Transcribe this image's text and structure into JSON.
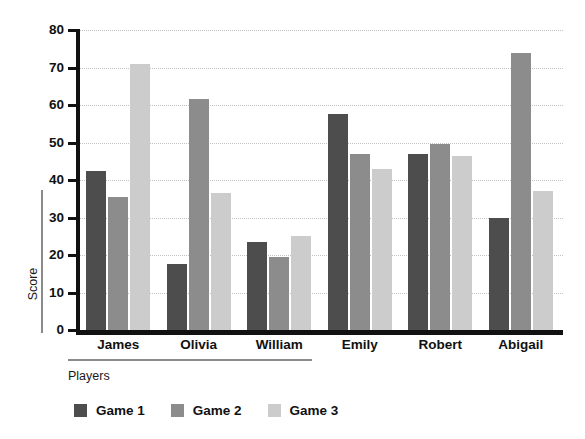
{
  "chart_data": {
    "type": "bar",
    "title": "",
    "xlabel": "Players",
    "ylabel": "Score",
    "categories": [
      "James",
      "Olivia",
      "William",
      "Emily",
      "Robert",
      "Abigail"
    ],
    "series": [
      {
        "name": "Game 1",
        "color": "#4d4d4d",
        "values": [
          42.5,
          17.5,
          23.5,
          57.5,
          47.0,
          30.0
        ]
      },
      {
        "name": "Game 2",
        "color": "#8c8c8c",
        "values": [
          35.5,
          61.5,
          19.5,
          47.0,
          49.5,
          74.0
        ]
      },
      {
        "name": "Game 3",
        "color": "#cccccc",
        "values": [
          71.0,
          36.5,
          25.0,
          43.0,
          46.5,
          37.0
        ]
      }
    ],
    "ylim": [
      0,
      80
    ],
    "yticks": [
      0,
      10,
      20,
      30,
      40,
      50,
      60,
      70,
      80
    ],
    "ytick_labels": [
      "0",
      "10",
      "20",
      "30",
      "40",
      "50",
      "60",
      "70",
      "80"
    ],
    "grid": true,
    "grid_style": "dotted",
    "grid_color": "#c2c2c2",
    "legend_position": "bottom-left",
    "axis_color": "#111111",
    "background": "#ffffff"
  }
}
